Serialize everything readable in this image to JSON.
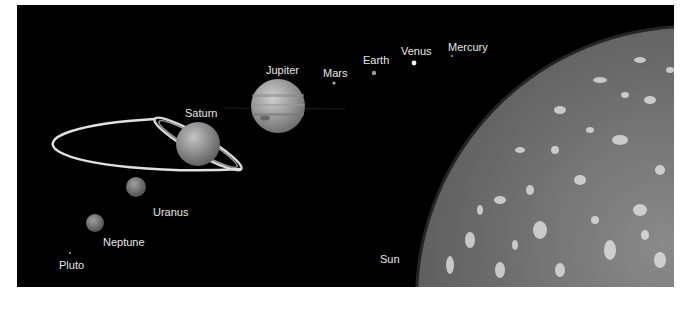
{
  "diagram": {
    "title": "",
    "background": "#000000",
    "bodies": [
      {
        "name": "Mercury",
        "label": "Mercury"
      },
      {
        "name": "Venus",
        "label": "Venus"
      },
      {
        "name": "Earth",
        "label": "Earth"
      },
      {
        "name": "Mars",
        "label": "Mars"
      },
      {
        "name": "Jupiter",
        "label": "Jupiter"
      },
      {
        "name": "Saturn",
        "label": "Saturn"
      },
      {
        "name": "Uranus",
        "label": "Uranus"
      },
      {
        "name": "Neptune",
        "label": "Neptune"
      },
      {
        "name": "Pluto",
        "label": "Pluto"
      },
      {
        "name": "Sun",
        "label": "Sun"
      }
    ]
  }
}
